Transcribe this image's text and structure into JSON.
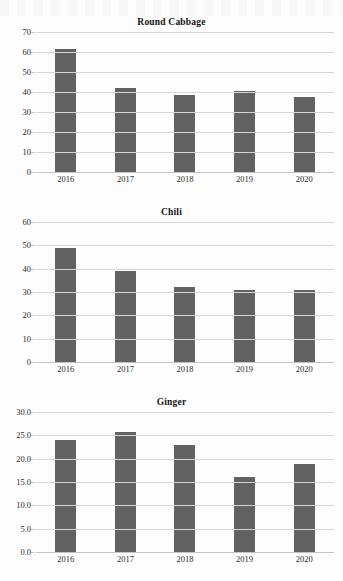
{
  "document": {
    "type": "scanned-report-page",
    "background_color": "#fdfdfd",
    "bar_color": "#626262",
    "gridline_color": "#d6d6d6"
  },
  "charts": [
    {
      "id": "round-cabbage",
      "title": "Round Cabbage",
      "categories": [
        "2016",
        "2017",
        "2018",
        "2019",
        "2020"
      ],
      "values": [
        61.5,
        42.0,
        38.5,
        40.3,
        37.4
      ],
      "yticks": [
        "0",
        "10",
        "20",
        "30",
        "40",
        "50",
        "60",
        "70"
      ],
      "ymin": 0,
      "ymax": 70
    },
    {
      "id": "chili",
      "title": "Chili",
      "categories": [
        "2016",
        "2017",
        "2018",
        "2019",
        "2020"
      ],
      "values": [
        49.0,
        38.8,
        32.0,
        30.8,
        31.0
      ],
      "yticks": [
        "0",
        "10",
        "20",
        "30",
        "40",
        "50",
        "60"
      ],
      "ymin": 0,
      "ymax": 60
    },
    {
      "id": "ginger",
      "title": "Ginger",
      "categories": [
        "2016",
        "2017",
        "2018",
        "2019",
        "2020"
      ],
      "values": [
        24.0,
        25.8,
        23.0,
        16.1,
        18.8
      ],
      "yticks": [
        "0.0",
        "5.0",
        "10.0",
        "15.0",
        "20.0",
        "25.0",
        "30.0"
      ],
      "ymin": 0,
      "ymax": 30
    }
  ],
  "chart_data": [
    {
      "type": "bar",
      "title": "Round Cabbage",
      "xlabel": "",
      "ylabel": "",
      "categories": [
        "2016",
        "2017",
        "2018",
        "2019",
        "2020"
      ],
      "values": [
        61.5,
        42.0,
        38.5,
        40.3,
        37.4
      ],
      "ylim": [
        0,
        70
      ],
      "ytick_values": [
        0,
        10,
        20,
        30,
        40,
        50,
        60,
        70
      ],
      "grid": true,
      "legend": "none",
      "bar_color": "#626262"
    },
    {
      "type": "bar",
      "title": "Chili",
      "xlabel": "",
      "ylabel": "",
      "categories": [
        "2016",
        "2017",
        "2018",
        "2019",
        "2020"
      ],
      "values": [
        49.0,
        38.8,
        32.0,
        30.8,
        31.0
      ],
      "ylim": [
        0,
        60
      ],
      "ytick_values": [
        0,
        10,
        20,
        30,
        40,
        50,
        60
      ],
      "grid": true,
      "legend": "none",
      "bar_color": "#626262"
    },
    {
      "type": "bar",
      "title": "Ginger",
      "xlabel": "",
      "ylabel": "",
      "categories": [
        "2016",
        "2017",
        "2018",
        "2019",
        "2020"
      ],
      "values": [
        24.0,
        25.8,
        23.0,
        16.1,
        18.8
      ],
      "ylim": [
        0,
        30
      ],
      "ytick_values": [
        0.0,
        5.0,
        10.0,
        15.0,
        20.0,
        25.0,
        30.0
      ],
      "grid": true,
      "legend": "none",
      "bar_color": "#626262"
    }
  ]
}
